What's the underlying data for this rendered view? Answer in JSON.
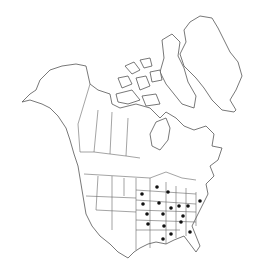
{
  "map": {
    "title": "North America distribution map",
    "region": "North America",
    "dot_color": "#111111",
    "line_color": "#555555",
    "occurrences": [
      {
        "x": 157,
        "y": 187
      },
      {
        "x": 168,
        "y": 192
      },
      {
        "x": 142,
        "y": 194
      },
      {
        "x": 159,
        "y": 203
      },
      {
        "x": 143,
        "y": 204
      },
      {
        "x": 200,
        "y": 201
      },
      {
        "x": 179,
        "y": 206
      },
      {
        "x": 188,
        "y": 206
      },
      {
        "x": 171,
        "y": 208
      },
      {
        "x": 147,
        "y": 214
      },
      {
        "x": 163,
        "y": 214
      },
      {
        "x": 183,
        "y": 216
      },
      {
        "x": 148,
        "y": 224
      },
      {
        "x": 164,
        "y": 226
      },
      {
        "x": 181,
        "y": 222
      },
      {
        "x": 190,
        "y": 232
      },
      {
        "x": 171,
        "y": 234
      },
      {
        "x": 163,
        "y": 239
      }
    ]
  }
}
